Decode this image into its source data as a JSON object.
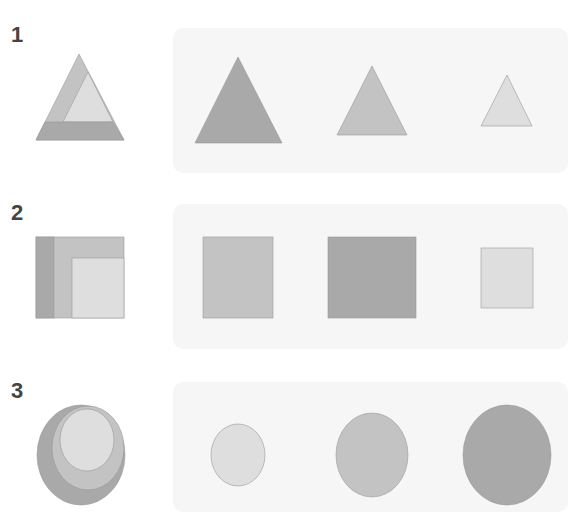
{
  "colors": {
    "dark": "#a9a9a9",
    "medium": "#c3c3c3",
    "light": "#dedede",
    "stroke": "#999999",
    "panel": "#f6f6f6",
    "label": "#444444"
  },
  "rows": [
    {
      "label": "1",
      "shape": "triangle",
      "composite": {
        "layers": [
          "dark-band-bottom",
          "medium-left",
          "light-inner"
        ]
      },
      "options": [
        {
          "size": "large",
          "fill": "dark"
        },
        {
          "size": "medium",
          "fill": "medium"
        },
        {
          "size": "small",
          "fill": "light"
        }
      ]
    },
    {
      "label": "2",
      "shape": "square",
      "composite": {
        "layers": [
          "dark-strip-left",
          "medium-middle",
          "light-inner"
        ]
      },
      "options": [
        {
          "size": "large",
          "fill": "medium"
        },
        {
          "size": "large",
          "fill": "dark"
        },
        {
          "size": "small",
          "fill": "light"
        }
      ]
    },
    {
      "label": "3",
      "shape": "circle",
      "composite": {
        "layers": [
          "dark-outer",
          "medium-middle",
          "light-inner"
        ]
      },
      "options": [
        {
          "size": "small",
          "fill": "light"
        },
        {
          "size": "medium",
          "fill": "medium"
        },
        {
          "size": "large",
          "fill": "dark"
        }
      ]
    }
  ]
}
